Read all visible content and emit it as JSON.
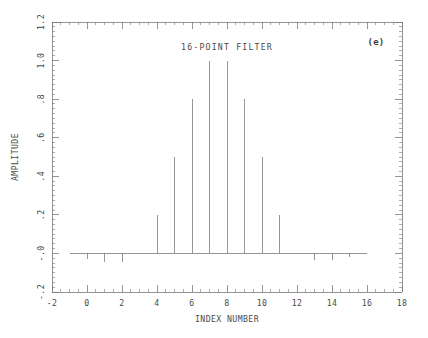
{
  "figure": {
    "panel_label": "(e)",
    "title": "16-POINT FILTER",
    "line_color": "#7a7a7a",
    "text_color": "#4a4a4a",
    "background": "#ffffff"
  },
  "chart_data": {
    "type": "line",
    "subtype": "stem-impulse",
    "title": "16-POINT FILTER",
    "xlabel": "INDEX NUMBER",
    "ylabel": "AMPLITUDE",
    "xlim": [
      -2,
      18
    ],
    "ylim": [
      -0.2,
      1.2
    ],
    "xticks": [
      -2,
      0,
      2,
      4,
      6,
      8,
      10,
      12,
      14,
      16,
      18
    ],
    "xticklabels": [
      "-2",
      "0",
      "2",
      "4",
      "6",
      "8",
      "10",
      "12",
      "14",
      "16",
      "18"
    ],
    "yticks": [
      -0.2,
      0.0,
      0.2,
      0.4,
      0.6,
      0.8,
      1.0,
      1.2
    ],
    "yticklabels": [
      "-.2",
      "-.0",
      ".2",
      ".4",
      ".6",
      ".8",
      "1.0",
      "1.2"
    ],
    "x_minor_step": 0.5,
    "y_minor_step": 0.025,
    "grid": false,
    "legend": null,
    "annotations": [
      {
        "text": "(e)",
        "x": 16.6,
        "y": 1.11
      }
    ],
    "x": [
      -1,
      0,
      1,
      2,
      3,
      4,
      5,
      6,
      7,
      8,
      9,
      10,
      11,
      12,
      13,
      14,
      15,
      16
    ],
    "values": [
      0.0,
      -0.03,
      -0.045,
      -0.045,
      0.0,
      0.2,
      0.5,
      0.8,
      1.0,
      1.0,
      0.8,
      0.5,
      0.2,
      0.0,
      -0.035,
      -0.035,
      -0.02,
      0.0
    ],
    "baseline": 0.0
  },
  "axes_labels": {
    "x_title": "INDEX NUMBER",
    "y_title": "AMPLITUDE"
  }
}
